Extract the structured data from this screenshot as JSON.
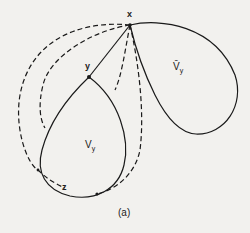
{
  "figure": {
    "panel_label": "(a)",
    "points": {
      "x": {
        "label": "x",
        "pos": [
          130,
          25
        ]
      },
      "y": {
        "label": "y",
        "pos": [
          89,
          77
        ]
      },
      "z": {
        "label": "z",
        "pos": [
          63,
          187
        ]
      }
    },
    "regions": {
      "v_y": {
        "label": "V",
        "subscript": "y"
      },
      "v_y_bar": {
        "label": "V̄",
        "subscript": "y"
      }
    },
    "colors": {
      "stroke": "#1a1a1a",
      "background": "#f2f1ee"
    }
  }
}
